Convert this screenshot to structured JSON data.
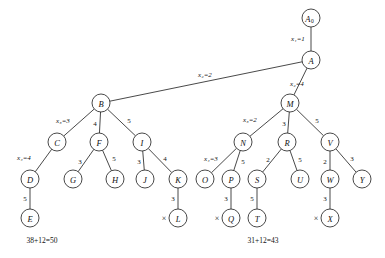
{
  "diagram": {
    "type": "tree",
    "stroke_color": "#1a1a1a",
    "text_color": "#111111",
    "background": "#ffffff",
    "node_radius": 9,
    "nodes": [
      {
        "id": "A0",
        "label": "A",
        "sub": "0",
        "x": 311,
        "y": 18
      },
      {
        "id": "A",
        "label": "A",
        "sub": "",
        "x": 311,
        "y": 60
      },
      {
        "id": "B",
        "label": "B",
        "sub": "",
        "x": 101,
        "y": 103
      },
      {
        "id": "M",
        "label": "M",
        "sub": "",
        "x": 290,
        "y": 103
      },
      {
        "id": "C",
        "label": "C",
        "sub": "",
        "x": 57,
        "y": 142
      },
      {
        "id": "F",
        "label": "F",
        "sub": "",
        "x": 99,
        "y": 142
      },
      {
        "id": "I",
        "label": "I",
        "sub": "",
        "x": 142,
        "y": 142
      },
      {
        "id": "N",
        "label": "N",
        "sub": "",
        "x": 243,
        "y": 142
      },
      {
        "id": "R",
        "label": "R",
        "sub": "",
        "x": 287,
        "y": 142
      },
      {
        "id": "V",
        "label": "V",
        "sub": "",
        "x": 330,
        "y": 142
      },
      {
        "id": "D",
        "label": "D",
        "sub": "",
        "x": 30,
        "y": 179
      },
      {
        "id": "G",
        "label": "G",
        "sub": "",
        "x": 73,
        "y": 179
      },
      {
        "id": "H",
        "label": "H",
        "sub": "",
        "x": 115,
        "y": 179
      },
      {
        "id": "J",
        "label": "J",
        "sub": "",
        "x": 145,
        "y": 179
      },
      {
        "id": "K",
        "label": "K",
        "sub": "",
        "x": 178,
        "y": 179
      },
      {
        "id": "O",
        "label": "O",
        "sub": "",
        "x": 205,
        "y": 179
      },
      {
        "id": "P",
        "label": "P",
        "sub": "",
        "x": 231,
        "y": 179
      },
      {
        "id": "S",
        "label": "S",
        "sub": "",
        "x": 257,
        "y": 179
      },
      {
        "id": "U",
        "label": "U",
        "sub": "",
        "x": 300,
        "y": 179
      },
      {
        "id": "W",
        "label": "W",
        "sub": "",
        "x": 330,
        "y": 179
      },
      {
        "id": "Y",
        "label": "Y",
        "sub": "",
        "x": 362,
        "y": 179
      },
      {
        "id": "E",
        "label": "E",
        "sub": "",
        "x": 30,
        "y": 218
      },
      {
        "id": "L",
        "label": "L",
        "sub": "",
        "x": 178,
        "y": 218
      },
      {
        "id": "Q",
        "label": "Q",
        "sub": "",
        "x": 231,
        "y": 218
      },
      {
        "id": "T",
        "label": "T",
        "sub": "",
        "x": 257,
        "y": 218
      },
      {
        "id": "X",
        "label": "X",
        "sub": "",
        "x": 330,
        "y": 218
      }
    ],
    "edges": [
      {
        "from": "A0",
        "to": "A",
        "label": "x₁=1",
        "italic": true,
        "lx": 298,
        "ly": 39
      },
      {
        "from": "A",
        "to": "B",
        "label": "x₂=2",
        "italic": true,
        "lx": 205,
        "ly": 75
      },
      {
        "from": "A",
        "to": "M",
        "label": "x₂=4",
        "italic": true,
        "lx": 297,
        "ly": 84
      },
      {
        "from": "B",
        "to": "C",
        "label": "x₃=3",
        "italic": true,
        "lx": 63,
        "ly": 121
      },
      {
        "from": "B",
        "to": "F",
        "label": "4",
        "italic": false,
        "lx": 95,
        "ly": 124
      },
      {
        "from": "B",
        "to": "I",
        "label": "5",
        "italic": false,
        "lx": 129,
        "ly": 121
      },
      {
        "from": "M",
        "to": "N",
        "label": "x₃=2",
        "italic": true,
        "lx": 250,
        "ly": 120
      },
      {
        "from": "M",
        "to": "R",
        "label": "3",
        "italic": false,
        "lx": 284,
        "ly": 124
      },
      {
        "from": "M",
        "to": "V",
        "label": "5",
        "italic": false,
        "lx": 317,
        "ly": 121
      },
      {
        "from": "C",
        "to": "D",
        "label": "x₄=4",
        "italic": true,
        "lx": 24,
        "ly": 158
      },
      {
        "from": "F",
        "to": "G",
        "label": "3",
        "italic": false,
        "lx": 80,
        "ly": 162
      },
      {
        "from": "F",
        "to": "H",
        "label": "5",
        "italic": false,
        "lx": 114,
        "ly": 159
      },
      {
        "from": "I",
        "to": "J",
        "label": "3",
        "italic": false,
        "lx": 139,
        "ly": 162
      },
      {
        "from": "I",
        "to": "K",
        "label": "4",
        "italic": false,
        "lx": 165,
        "ly": 159
      },
      {
        "from": "N",
        "to": "O",
        "label": "x₄=3",
        "italic": true,
        "lx": 211,
        "ly": 159
      },
      {
        "from": "N",
        "to": "P",
        "label": "5",
        "italic": false,
        "lx": 243,
        "ly": 162
      },
      {
        "from": "R",
        "to": "S",
        "label": "2",
        "italic": false,
        "lx": 268,
        "ly": 160
      },
      {
        "from": "R",
        "to": "U",
        "label": "5",
        "italic": false,
        "lx": 300,
        "ly": 160
      },
      {
        "from": "V",
        "to": "W",
        "label": "2",
        "italic": false,
        "lx": 325,
        "ly": 162
      },
      {
        "from": "V",
        "to": "Y",
        "label": "3",
        "italic": false,
        "lx": 352,
        "ly": 159
      },
      {
        "from": "D",
        "to": "E",
        "label": "5",
        "italic": false,
        "lx": 25,
        "ly": 199
      },
      {
        "from": "K",
        "to": "L",
        "label": "3",
        "italic": false,
        "lx": 173,
        "ly": 199
      },
      {
        "from": "P",
        "to": "Q",
        "label": "3",
        "italic": false,
        "lx": 226,
        "ly": 199
      },
      {
        "from": "S",
        "to": "T",
        "label": "5",
        "italic": false,
        "lx": 252,
        "ly": 199
      },
      {
        "from": "W",
        "to": "X",
        "label": "3",
        "italic": false,
        "lx": 325,
        "ly": 199
      }
    ],
    "cross_marks": [
      {
        "node": "L",
        "symbol": "×",
        "x": 164,
        "y": 218
      },
      {
        "node": "Q",
        "symbol": "×",
        "x": 217,
        "y": 218
      },
      {
        "node": "X",
        "symbol": "×",
        "x": 316,
        "y": 218
      }
    ],
    "sum_labels": [
      {
        "text": "38+12=50",
        "x": 42,
        "y": 240
      },
      {
        "text": "31+12=43",
        "x": 263,
        "y": 240
      }
    ]
  }
}
